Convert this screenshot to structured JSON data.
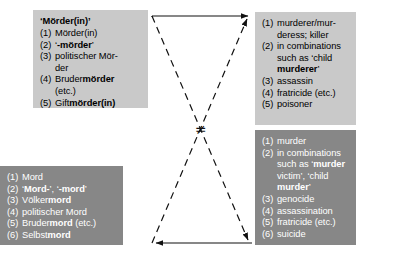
{
  "diagram": {
    "relation_symbol": "≠",
    "colors": {
      "light_box_bg": "#c9c9c9",
      "dark_box_bg": "#878787",
      "light_box_text": "#000000",
      "dark_box_text": "#ffffff",
      "line": "#111111",
      "page_bg": "#ffffff"
    },
    "boxes": {
      "german_murderer": {
        "header": "‘Mörder(in)’",
        "items": [
          {
            "num": "(1)",
            "parts": [
              {
                "t": "Mörder(in)",
                "b": false
              }
            ]
          },
          {
            "num": "(2)",
            "parts": [
              {
                "t": "‘",
                "b": false
              },
              {
                "t": "-mörder",
                "b": true
              },
              {
                "t": "’",
                "b": false
              }
            ]
          },
          {
            "num": "(3)",
            "parts": [
              {
                "t": "politischer Mör-",
                "b": false
              }
            ],
            "cont": "der"
          },
          {
            "num": "(4)",
            "parts": [
              {
                "t": "Bruder",
                "b": false
              },
              {
                "t": "mörder",
                "b": true
              }
            ],
            "cont": "(etc.)"
          },
          {
            "num": "(5)",
            "parts": [
              {
                "t": "Gift",
                "b": false
              },
              {
                "t": "mörder(in)",
                "b": true
              }
            ]
          }
        ]
      },
      "english_murderer": {
        "header": "",
        "items": [
          {
            "num": "(1)",
            "parts": [
              {
                "t": "murderer/mur-",
                "b": false
              }
            ],
            "cont": "deress; killer"
          },
          {
            "num": "(2)",
            "parts": [
              {
                "t": "in combinations",
                "b": false
              }
            ],
            "cont2": [
              [
                {
                  "t": "such as ‘child",
                  "b": false
                }
              ],
              [
                {
                  "t": "murderer",
                  "b": true
                },
                {
                  "t": "’",
                  "b": false
                }
              ]
            ]
          },
          {
            "num": "(3)",
            "parts": [
              {
                "t": "assassin",
                "b": false
              }
            ]
          },
          {
            "num": "(4)",
            "parts": [
              {
                "t": "fratricide (etc.)",
                "b": false
              }
            ]
          },
          {
            "num": "(5)",
            "parts": [
              {
                "t": "poisoner",
                "b": false
              }
            ]
          }
        ]
      },
      "german_mord": {
        "header": "",
        "items": [
          {
            "num": "(1)",
            "parts": [
              {
                "t": "Mord",
                "b": false
              }
            ]
          },
          {
            "num": "(2)",
            "parts": [
              {
                "t": "‘",
                "b": false
              },
              {
                "t": "Mord-",
                "b": true
              },
              {
                "t": "’, ‘",
                "b": false
              },
              {
                "t": "-mord",
                "b": true
              },
              {
                "t": "’",
                "b": false
              }
            ]
          },
          {
            "num": "(3)",
            "parts": [
              {
                "t": "Völker",
                "b": false
              },
              {
                "t": "mord",
                "b": true
              }
            ]
          },
          {
            "num": "(4)",
            "parts": [
              {
                "t": "politischer Mord",
                "b": false
              }
            ]
          },
          {
            "num": "(5)",
            "parts": [
              {
                "t": "Bruder",
                "b": false
              },
              {
                "t": "mord",
                "b": true
              },
              {
                "t": " (etc.)",
                "b": false
              }
            ]
          },
          {
            "num": "(6)",
            "parts": [
              {
                "t": "Selbst",
                "b": false
              },
              {
                "t": "mord",
                "b": true
              }
            ]
          }
        ]
      },
      "english_mord": {
        "header": "",
        "items": [
          {
            "num": "(1)",
            "parts": [
              {
                "t": "murder",
                "b": false
              }
            ]
          },
          {
            "num": "(2)",
            "parts": [
              {
                "t": "in combinations",
                "b": false
              }
            ],
            "cont2": [
              [
                {
                  "t": "such as ‘",
                  "b": false
                },
                {
                  "t": "murder",
                  "b": true
                }
              ],
              [
                {
                  "t": "victim’, ‘child",
                  "b": false
                }
              ],
              [
                {
                  "t": "murder",
                  "b": true
                },
                {
                  "t": "’",
                  "b": false
                }
              ]
            ]
          },
          {
            "num": "(3)",
            "parts": [
              {
                "t": "genocide",
                "b": false
              }
            ]
          },
          {
            "num": "(4)",
            "parts": [
              {
                "t": "assassination",
                "b": false
              }
            ]
          },
          {
            "num": "(5)",
            "parts": [
              {
                "t": "fratricide (etc.)",
                "b": false
              }
            ]
          },
          {
            "num": "(6)",
            "parts": [
              {
                "t": "suicide",
                "b": false
              }
            ]
          }
        ]
      }
    }
  }
}
